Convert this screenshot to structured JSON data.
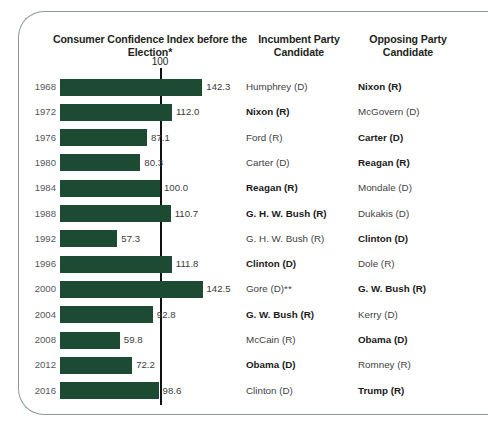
{
  "header": {
    "chart_title": "Consumer Confidence Index before the Election*",
    "incumbent_column": "Incumbent Party Candidate",
    "opposing_column": "Opposing Party Candidate",
    "reference_label": "100"
  },
  "colors": {
    "bar": "#1d4a33",
    "reference_line": "#111111",
    "card_border": "#8d9a96",
    "year_text": "#55585a"
  },
  "chart_data": {
    "type": "bar",
    "title": "Consumer Confidence Index before the Election*",
    "xlabel": "",
    "ylabel": "",
    "orientation": "horizontal",
    "grid": false,
    "xlim": [
      0,
      150
    ],
    "reference_line": 100,
    "reference_line_label": "100",
    "categories": [
      "1968",
      "1972",
      "1976",
      "1980",
      "1984",
      "1988",
      "1992",
      "1996",
      "2000",
      "2004",
      "2008",
      "2012",
      "2016"
    ],
    "values": [
      142.3,
      112.0,
      87.1,
      80.3,
      100.0,
      110.7,
      57.3,
      111.8,
      142.5,
      92.8,
      59.8,
      72.2,
      98.6
    ],
    "value_labels": [
      "142.3",
      "112.0",
      "87.1",
      "80.3",
      "100.0",
      "110.7",
      "57.3",
      "111.8",
      "142.5",
      "92.8",
      "59.8",
      "72.2",
      "98.6"
    ],
    "series": [
      {
        "name": "Consumer Confidence Index",
        "values": [
          142.3,
          112.0,
          87.1,
          80.3,
          100.0,
          110.7,
          57.3,
          111.8,
          142.5,
          92.8,
          59.8,
          72.2,
          98.6
        ]
      }
    ],
    "annotations": [
      "* Consumer Confidence Index before the Election",
      "** Gore (D)"
    ]
  },
  "rows": [
    {
      "year": "1968",
      "value": 142.3,
      "value_label": "142.3",
      "incumbent": "Humphrey (D)",
      "incumbent_winner": false,
      "opposing": "Nixon (R)",
      "opposing_winner": true
    },
    {
      "year": "1972",
      "value": 112.0,
      "value_label": "112.0",
      "incumbent": "Nixon (R)",
      "incumbent_winner": true,
      "opposing": "McGovern (D)",
      "opposing_winner": false
    },
    {
      "year": "1976",
      "value": 87.1,
      "value_label": "87.1",
      "incumbent": "Ford (R)",
      "incumbent_winner": false,
      "opposing": "Carter (D)",
      "opposing_winner": true
    },
    {
      "year": "1980",
      "value": 80.3,
      "value_label": "80.3",
      "incumbent": "Carter (D)",
      "incumbent_winner": false,
      "opposing": "Reagan (R)",
      "opposing_winner": true
    },
    {
      "year": "1984",
      "value": 100.0,
      "value_label": "100.0",
      "incumbent": "Reagan (R)",
      "incumbent_winner": true,
      "opposing": "Mondale (D)",
      "opposing_winner": false
    },
    {
      "year": "1988",
      "value": 110.7,
      "value_label": "110.7",
      "incumbent": "G. H. W. Bush (R)",
      "incumbent_winner": true,
      "opposing": "Dukakis (D)",
      "opposing_winner": false
    },
    {
      "year": "1992",
      "value": 57.3,
      "value_label": "57.3",
      "incumbent": "G. H. W. Bush (R)",
      "incumbent_winner": false,
      "opposing": "Clinton (D)",
      "opposing_winner": true
    },
    {
      "year": "1996",
      "value": 111.8,
      "value_label": "111.8",
      "incumbent": "Clinton (D)",
      "incumbent_winner": true,
      "opposing": "Dole (R)",
      "opposing_winner": false
    },
    {
      "year": "2000",
      "value": 142.5,
      "value_label": "142.5",
      "incumbent": "Gore (D)**",
      "incumbent_winner": false,
      "opposing": "G. W. Bush (R)",
      "opposing_winner": true
    },
    {
      "year": "2004",
      "value": 92.8,
      "value_label": "92.8",
      "incumbent": "G. W. Bush (R)",
      "incumbent_winner": true,
      "opposing": "Kerry (D)",
      "opposing_winner": false
    },
    {
      "year": "2008",
      "value": 59.8,
      "value_label": "59.8",
      "incumbent": "McCain (R)",
      "incumbent_winner": false,
      "opposing": "Obama (D)",
      "opposing_winner": true
    },
    {
      "year": "2012",
      "value": 72.2,
      "value_label": "72.2",
      "incumbent": "Obama (D)",
      "incumbent_winner": true,
      "opposing": "Romney (R)",
      "opposing_winner": false
    },
    {
      "year": "2016",
      "value": 98.6,
      "value_label": "98.6",
      "incumbent": "Clinton (D)",
      "incumbent_winner": false,
      "opposing": "Trump (R)",
      "opposing_winner": true
    }
  ]
}
